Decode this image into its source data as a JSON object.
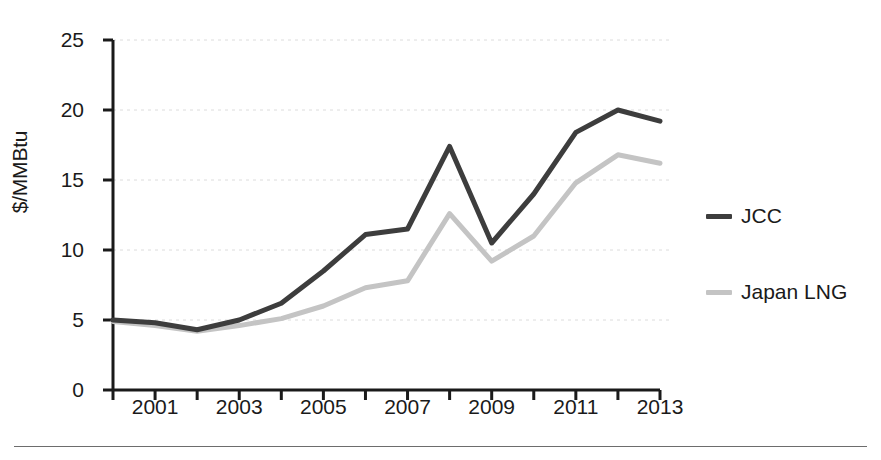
{
  "chart_data": {
    "type": "line",
    "title": "",
    "subtitle": "",
    "xlabel": "",
    "ylabel": "$/MMBtu",
    "x": [
      2000,
      2001,
      2002,
      2003,
      2004,
      2005,
      2006,
      2007,
      2008,
      2009,
      2010,
      2011,
      2012,
      2013
    ],
    "xlim": [
      2000,
      2013
    ],
    "ylim": [
      0,
      25
    ],
    "xticks": [
      2000,
      2001,
      2002,
      2003,
      2004,
      2005,
      2006,
      2007,
      2008,
      2009,
      2010,
      2011,
      2012,
      2013
    ],
    "xtick_labels": [
      "2001",
      "2003",
      "2005",
      "2007",
      "2009",
      "2011",
      "2013"
    ],
    "xtick_label_values": [
      2001,
      2003,
      2005,
      2007,
      2009,
      2011,
      2013
    ],
    "yticks": [
      0,
      5,
      10,
      15,
      20,
      25
    ],
    "ytick_labels": [
      "0",
      "5",
      "10",
      "15",
      "20",
      "25"
    ],
    "grid": "horizontal-dotted",
    "legend_position": "right",
    "series": [
      {
        "name": "JCC",
        "color": "#3d3d3d",
        "values": [
          5.0,
          4.8,
          4.3,
          5.0,
          6.2,
          8.5,
          11.1,
          11.5,
          17.4,
          10.5,
          14.0,
          18.4,
          20.0,
          19.2
        ]
      },
      {
        "name": "Japan LNG",
        "color": "#c4c4c4",
        "values": [
          4.9,
          4.6,
          4.2,
          4.6,
          5.1,
          6.0,
          7.3,
          7.8,
          12.6,
          9.2,
          11.0,
          14.8,
          16.8,
          16.2
        ]
      }
    ]
  },
  "axis": {
    "y_label": "$/MMBtu",
    "y_tick_labels": [
      "0",
      "5",
      "10",
      "15",
      "20",
      "25"
    ],
    "x_tick_labels": [
      "2001",
      "2003",
      "2005",
      "2007",
      "2009",
      "2011",
      "2013"
    ]
  },
  "legend": {
    "items": [
      {
        "label": "JCC",
        "color": "#3d3d3d"
      },
      {
        "label": "Japan LNG",
        "color": "#c4c4c4"
      }
    ]
  }
}
